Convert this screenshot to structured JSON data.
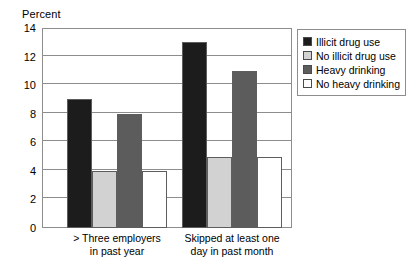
{
  "chart_data": {
    "type": "bar",
    "title": "",
    "subtitle": "",
    "xlabel": "",
    "ylabel": "Percent",
    "ylim": [
      0,
      14
    ],
    "ytick_step": 2,
    "yticks": [
      0,
      2,
      4,
      6,
      8,
      10,
      12,
      14
    ],
    "ytick_labels": [
      "0",
      "2",
      "4",
      "6",
      "8",
      "10",
      "12",
      "14"
    ],
    "grid": true,
    "grid_axis": "y",
    "legend_position": "right-top",
    "categories": [
      "> Three employers\nin past year",
      "Skipped at least one\nday in past month"
    ],
    "category_lines": [
      [
        "> Three employers",
        "in past year"
      ],
      [
        "Skipped at least one",
        "day in past month"
      ]
    ],
    "series": [
      {
        "name": "Illicit drug use",
        "color": "#1c1c1c",
        "values": [
          9,
          13
        ]
      },
      {
        "name": "No illicit drug use",
        "color": "#d2d2d2",
        "values": [
          4,
          5
        ]
      },
      {
        "name": "Heavy drinking",
        "color": "#5c5c5c",
        "values": [
          8,
          11
        ]
      },
      {
        "name": "No heavy drinking",
        "color": "#ffffff",
        "values": [
          4,
          5
        ]
      }
    ],
    "annotations": []
  },
  "legend": {
    "items": [
      {
        "label": "Illicit drug use",
        "color": "#1c1c1c"
      },
      {
        "label": "No illicit drug use",
        "color": "#d2d2d2"
      },
      {
        "label": "Heavy drinking",
        "color": "#5c5c5c"
      },
      {
        "label": "No heavy drinking",
        "color": "#ffffff"
      }
    ]
  },
  "colors": {
    "axis": "#8d8d8d",
    "bar_outline": "#5d5d5d",
    "text": "#000000",
    "background": "#ffffff"
  }
}
